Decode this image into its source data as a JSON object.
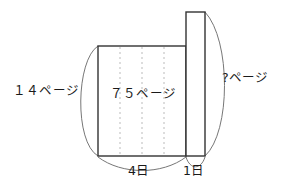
{
  "figure": {
    "type": "tape-bar-diagram",
    "labels": {
      "left_pages": "１４ページ",
      "middle_pages": "７５ページ",
      "right_pages": "?ページ",
      "days_main": "4日",
      "days_one": "1日"
    },
    "segments": {
      "main_bar_divisions": 4,
      "main_bar_value": "７５ページ",
      "main_bar_days": "4日",
      "tall_bar_value": "?ページ",
      "tall_bar_days": "1日",
      "brace_left_value": "１４ページ",
      "brace_right_value": "?ページ"
    },
    "colors": {
      "stroke": "#333333",
      "dotted": "#bbbbbb",
      "arc": "#777777",
      "text": "#1a1a1a",
      "background": "#ffffff"
    }
  }
}
